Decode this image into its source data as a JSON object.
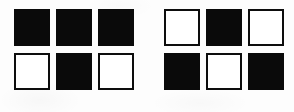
{
  "figure": {
    "background_color": "#fdfdfd",
    "black_color": "#0a0a0a",
    "white_color": "#ffffff",
    "border_color": "#0d0d0d",
    "grid_rows": 2,
    "grid_columns": 3,
    "group_count": 2
  },
  "groups": [
    {
      "name": "left-grid",
      "label": "Left pattern",
      "cells": [
        {
          "row": 1,
          "col": 1,
          "fill": "black",
          "label": "black square"
        },
        {
          "row": 1,
          "col": 2,
          "fill": "black",
          "label": "black square"
        },
        {
          "row": 1,
          "col": 3,
          "fill": "black",
          "label": "black square"
        },
        {
          "row": 2,
          "col": 1,
          "fill": "white",
          "label": "white square"
        },
        {
          "row": 2,
          "col": 2,
          "fill": "black",
          "label": "black square"
        },
        {
          "row": 2,
          "col": 3,
          "fill": "white",
          "label": "white square"
        }
      ]
    },
    {
      "name": "right-grid",
      "label": "Right pattern",
      "cells": [
        {
          "row": 1,
          "col": 1,
          "fill": "white",
          "label": "white square"
        },
        {
          "row": 1,
          "col": 2,
          "fill": "black",
          "label": "black square"
        },
        {
          "row": 1,
          "col": 3,
          "fill": "white",
          "label": "white square"
        },
        {
          "row": 2,
          "col": 1,
          "fill": "black",
          "label": "black square"
        },
        {
          "row": 2,
          "col": 2,
          "fill": "white",
          "label": "white square"
        },
        {
          "row": 2,
          "col": 3,
          "fill": "black",
          "label": "black square"
        }
      ]
    }
  ]
}
